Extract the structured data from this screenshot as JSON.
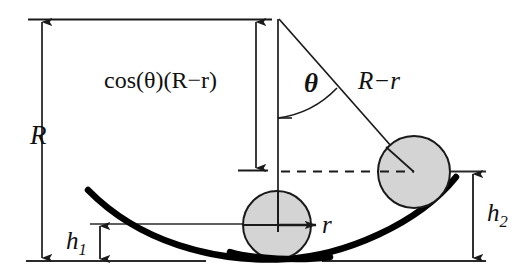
{
  "figure": {
    "background_color": "#ffffff",
    "stroke_color": "#1a1a1a",
    "ball_fill_color": "#d4d4d4",
    "ball_stroke_color": "#1a1a1a",
    "bowl_curve_color": "#000000",
    "labels": {
      "radius_R": "R",
      "cos_projection": "cos(θ)(R−r)",
      "angle_theta": "θ",
      "chord_R_minus_r": "R−r",
      "ball_radius_r": "r",
      "height_h1_base": "h",
      "height_h1_sub": "1",
      "height_h2_base": "h",
      "height_h2_sub": "2"
    },
    "icon_names": {
      "up_arrow": "arrow-up-icon",
      "down_arrow": "arrow-down-icon",
      "right_arrow": "arrow-right-icon",
      "angle_arc": "angle-arc-icon",
      "dashed_line": "dashed-horizontal-line-icon"
    },
    "elements": [
      "top-reference-line",
      "bottom-baseline-left",
      "bottom-baseline-right",
      "R-dimension-arrow",
      "cos-dimension-arrow",
      "h1-dimension-arrow",
      "h2-dimension-arrow",
      "bowl-curve",
      "center-ball",
      "right-ball",
      "vertical-axis-line",
      "radius-line-to-right-ball",
      "angle-arc",
      "dashed-horizontal-line",
      "ball-radius-arrow"
    ]
  }
}
